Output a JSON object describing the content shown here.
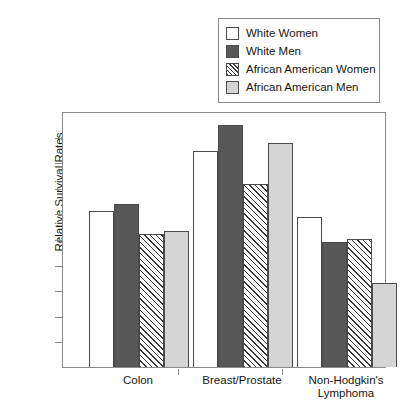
{
  "chart_data": {
    "type": "bar",
    "title": "",
    "xlabel": "",
    "ylabel": "Relative Survival Rates",
    "ylim": [
      0,
      100
    ],
    "yticks": [
      0,
      10,
      20,
      30,
      40,
      50,
      60,
      70,
      80,
      90,
      100
    ],
    "grid": false,
    "legend_position": "top-right",
    "categories": [
      "Colon",
      "Breast/Prostate",
      "Non-Hodgkin's\nLymphoma"
    ],
    "series": [
      {
        "name": "White Women",
        "style": "white",
        "values": [
          61,
          84.5,
          58.5
        ]
      },
      {
        "name": "White Men",
        "style": "dark",
        "values": [
          63.5,
          94.5,
          49
        ]
      },
      {
        "name": "African American Women",
        "style": "hatch",
        "values": [
          52,
          71.5,
          50
        ]
      },
      {
        "name": "African American Men",
        "style": "light",
        "values": [
          53,
          87.5,
          33
        ]
      }
    ]
  },
  "legend": {
    "items": [
      {
        "label": "White Women"
      },
      {
        "label": "White Men"
      },
      {
        "label": "African American Women"
      },
      {
        "label": "African American Men"
      }
    ]
  },
  "axes": {
    "y_title": "Relative Survival Rates",
    "y_ticks": [
      "100",
      "90",
      "80",
      "70",
      "60",
      "50",
      "40",
      "30",
      "20",
      "10",
      "0"
    ],
    "x_labels": [
      "Colon",
      "Breast/Prostate",
      "Non-Hodgkin's\nLymphoma"
    ]
  },
  "colors": {
    "white_fill": "#ffffff",
    "dark_fill": "#585858",
    "light_fill": "#d4d4d4",
    "hatch_line": "#3a3a3a",
    "outline": "#4a4a4a",
    "frame": "#8a8a8a"
  }
}
